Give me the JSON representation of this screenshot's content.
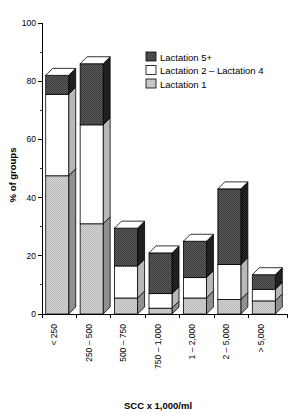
{
  "chart_data": {
    "type": "bar",
    "subtype": "stacked-bar-3d",
    "title": "",
    "xlabel": "SCC x 1,000/ml",
    "ylabel": "% of groups",
    "ylim": [
      0,
      100
    ],
    "ytick_labels": [
      "0",
      "20",
      "40",
      "60",
      "80",
      "100"
    ],
    "ytick_values": [
      0,
      20,
      40,
      60,
      80,
      100
    ],
    "yminor_values": [
      10,
      30,
      50,
      70,
      90
    ],
    "grid": false,
    "legend_position": "upper-right",
    "categories": [
      "< 250",
      "250 – 500",
      "500 – 750",
      "750 – 1,000",
      "1 – 2,000",
      "2 – 5,000",
      "> 5,000"
    ],
    "series": [
      {
        "name": "Lactation 1",
        "color": "#c8c8c8",
        "values": [
          47.5,
          31.0,
          5.5,
          2.0,
          5.5,
          5.0,
          4.5
        ]
      },
      {
        "name": "Lactation 2 – Lactation 4",
        "color": "#ffffff",
        "values": [
          28.0,
          34.0,
          11.0,
          5.0,
          7.0,
          12.0,
          4.0
        ]
      },
      {
        "name": "Lactation 5+",
        "color": "#4a4a4a",
        "values": [
          6.5,
          21.0,
          13.0,
          14.0,
          12.5,
          26.0,
          5.0
        ]
      }
    ],
    "totals": [
      82.0,
      86.0,
      29.5,
      21.0,
      25.0,
      43.0,
      13.5
    ]
  },
  "legend": {
    "entries": [
      {
        "label": "Lactation 5+",
        "swatch": "dark-gray-swatch"
      },
      {
        "label": "Lactation 2 – Lactation 4",
        "swatch": "white-swatch"
      },
      {
        "label": "Lactation 1",
        "swatch": "light-gray-swatch"
      }
    ]
  },
  "colors": {
    "lactation1": "#c8c8c8",
    "lactation2_4": "#ffffff",
    "lactation5plus": "#4a4a4a",
    "side_lactation1": "#8e8e8e",
    "side_lactation2_4": "#b5b5b5",
    "side_lactation5plus": "#232323",
    "top_face": "#ffffff",
    "axis": "#000000",
    "background": "#ffffff"
  }
}
